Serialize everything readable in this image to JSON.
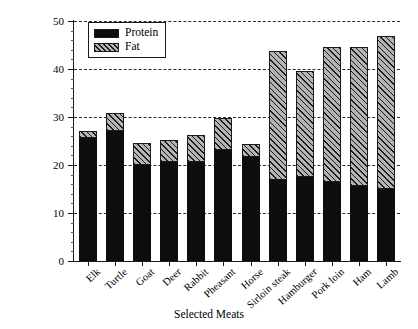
{
  "chart_data": {
    "type": "bar",
    "stacked": true,
    "title": "",
    "xlabel": "Selected Meats",
    "ylabel": "Grams (per 100 grams)",
    "ylim": [
      0,
      50
    ],
    "ytick_step": 10,
    "yminor_step": 2,
    "ytick_labels": [
      "0",
      "10",
      "20",
      "30",
      "40",
      "50"
    ],
    "grid": "horizontal-dashed",
    "legend_position": "top-left-inside",
    "categories": [
      "Elk",
      "Turtle",
      "Goat",
      "Deer",
      "Rabbit",
      "Pheasant",
      "Horse",
      "Sirloin steak",
      "Hamburger",
      "Pork loin",
      "Ham",
      "Lamb"
    ],
    "series": [
      {
        "name": "Protein",
        "color": "#0d0d0d",
        "fill": "solid-black",
        "values": [
          25.7,
          27.0,
          20.0,
          20.6,
          20.6,
          23.2,
          21.7,
          16.9,
          17.5,
          16.5,
          15.6,
          15.0
        ]
      },
      {
        "name": "Fat",
        "color": "#b4b4b4",
        "fill": "diagonal-hatch",
        "values": [
          1.3,
          3.8,
          4.5,
          4.6,
          5.6,
          6.6,
          2.7,
          26.9,
          22.1,
          28.0,
          28.9,
          31.8
        ]
      }
    ],
    "totals": [
      27.0,
      30.8,
      24.5,
      25.2,
      26.2,
      29.8,
      24.4,
      43.8,
      39.6,
      44.5,
      44.5,
      46.8
    ]
  },
  "legend": {
    "items": [
      {
        "label": "Protein",
        "swatch": "solid-black-swatch"
      },
      {
        "label": "Fat",
        "swatch": "hatched-swatch"
      }
    ]
  },
  "axes": {
    "y_title": "Grams (per 100 grams)",
    "x_title": "Selected Meats"
  }
}
